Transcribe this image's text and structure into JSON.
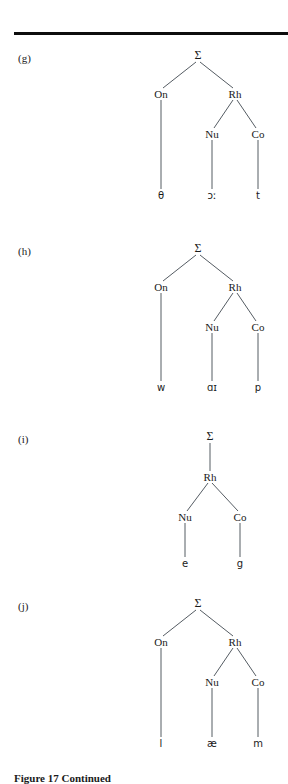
{
  "figure": {
    "caption": "Figure 17  Continued",
    "rule_visible": true,
    "node_color": "#1a1a1a",
    "line_color": "#555c63",
    "background": "#ffffff",
    "node_glossary": {
      "sigma": "syllable",
      "On": "onset",
      "Rh": "rhyme",
      "Nu": "nucleus",
      "Co": "coda"
    }
  },
  "trees": [
    {
      "label": "(g)",
      "word_transcription": "θɔːt",
      "root": "Σ",
      "nodes": {
        "sigma": "Σ",
        "onset": "On",
        "rhyme": "Rh",
        "nucleus": "Nu",
        "coda": "Co"
      },
      "terminals": {
        "onset": "θ",
        "nucleus": "ɔː",
        "coda": "t"
      },
      "has_onset": true
    },
    {
      "label": "(h)",
      "word_transcription": "wɑɪp",
      "root": "Σ",
      "nodes": {
        "sigma": "Σ",
        "onset": "On",
        "rhyme": "Rh",
        "nucleus": "Nu",
        "coda": "Co"
      },
      "terminals": {
        "onset": "w",
        "nucleus": "ɑɪ",
        "coda": "p"
      },
      "has_onset": true
    },
    {
      "label": "(i)",
      "word_transcription": "eg",
      "root": "Σ",
      "nodes": {
        "sigma": "Σ",
        "rhyme": "Rh",
        "nucleus": "Nu",
        "coda": "Co"
      },
      "terminals": {
        "nucleus": "e",
        "coda": "g"
      },
      "has_onset": false
    },
    {
      "label": "(j)",
      "word_transcription": "læm",
      "root": "Σ",
      "nodes": {
        "sigma": "Σ",
        "onset": "On",
        "rhyme": "Rh",
        "nucleus": "Nu",
        "coda": "Co"
      },
      "terminals": {
        "onset": "l",
        "nucleus": "æ",
        "coda": "m"
      },
      "has_onset": true
    }
  ]
}
